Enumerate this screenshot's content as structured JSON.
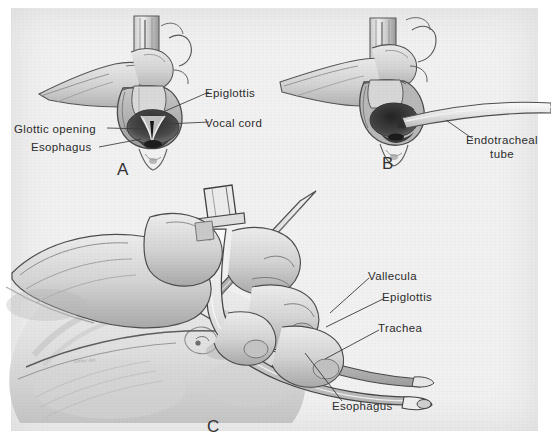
{
  "figure": {
    "background_color": "#f1f1f1",
    "page_color": "#ffffff",
    "ink_color": "#2c2c2c",
    "artist_signature": "Sibley del.",
    "medium": "pencil illustration (scanned halftone plate)"
  },
  "panels": [
    {
      "id": "A",
      "letter": "A",
      "caption": "Laryngoscopic view of the glottis",
      "labels": [
        {
          "name": "epiglottis",
          "text": "Epiglottis"
        },
        {
          "name": "vocal-cord",
          "text": "Vocal cord"
        },
        {
          "name": "glottic-opening",
          "text": "Glottic  opening"
        },
        {
          "name": "esophagus",
          "text": "Esophagus"
        }
      ]
    },
    {
      "id": "B",
      "letter": "B",
      "caption": "Endotracheal tube passing through the glottis",
      "labels": [
        {
          "name": "endotracheal-tube",
          "text_line1": "Endotracheal",
          "text_line2": "tube"
        }
      ]
    },
    {
      "id": "C",
      "letter": "C",
      "caption": "Sagittal view of laryngoscope and tube placement",
      "labels": [
        {
          "name": "vallecula",
          "text": "Vallecula"
        },
        {
          "name": "epiglottis",
          "text": "Epiglottis"
        },
        {
          "name": "trachea",
          "text": "Trachea"
        },
        {
          "name": "esophagus",
          "text": "Esophagus"
        }
      ]
    }
  ]
}
